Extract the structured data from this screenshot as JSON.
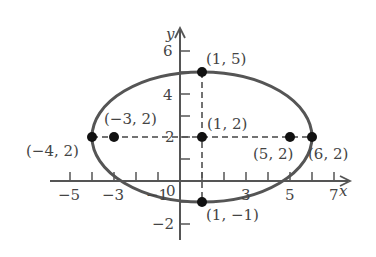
{
  "diagram": {
    "type": "ellipse-graph",
    "axes": {
      "x_label": "x",
      "y_label": "y",
      "x_ticks": [
        {
          "value": -5,
          "label": "−5"
        },
        {
          "value": -3,
          "label": "−3"
        },
        {
          "value": -1,
          "label": "−1"
        },
        {
          "value": 0,
          "label": "0"
        },
        {
          "value": 3,
          "label": "3"
        },
        {
          "value": 5,
          "label": "5"
        },
        {
          "value": 7,
          "label": "7"
        }
      ],
      "y_ticks": [
        {
          "value": 6,
          "label": "6"
        },
        {
          "value": 4,
          "label": "4"
        },
        {
          "value": 2,
          "label": "2"
        },
        {
          "value": -2,
          "label": "−2"
        }
      ]
    },
    "ellipse": {
      "center": [
        1,
        2
      ],
      "a": 5,
      "b": 3
    },
    "points": [
      {
        "x": 1,
        "y": 5,
        "label": "(1, 5)"
      },
      {
        "x": -4,
        "y": 2,
        "label": "(−4, 2)"
      },
      {
        "x": -3,
        "y": 2,
        "label": "(−3, 2)"
      },
      {
        "x": 1,
        "y": 2,
        "label": "(1, 2)"
      },
      {
        "x": 5,
        "y": 2,
        "label": "(5, 2)"
      },
      {
        "x": 6,
        "y": 2,
        "label": "(6, 2)"
      },
      {
        "x": 1,
        "y": -1,
        "label": "(1, −1)"
      }
    ],
    "colors": {
      "curve": "#555555",
      "axis": "#555555",
      "point": "#111111",
      "text": "#444444"
    }
  }
}
